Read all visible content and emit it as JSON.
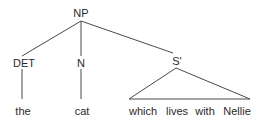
{
  "tree": {
    "root": {
      "label": "NP"
    },
    "children": [
      {
        "label": "DET",
        "leaf": "the"
      },
      {
        "label": "N",
        "leaf": "cat"
      },
      {
        "label": "S'",
        "leaves": [
          "which",
          "lives",
          "with",
          "Nellie"
        ]
      }
    ]
  },
  "colors": {
    "line": "#4a4a4a",
    "text": "#2a2a2a",
    "background": "#ffffff"
  }
}
